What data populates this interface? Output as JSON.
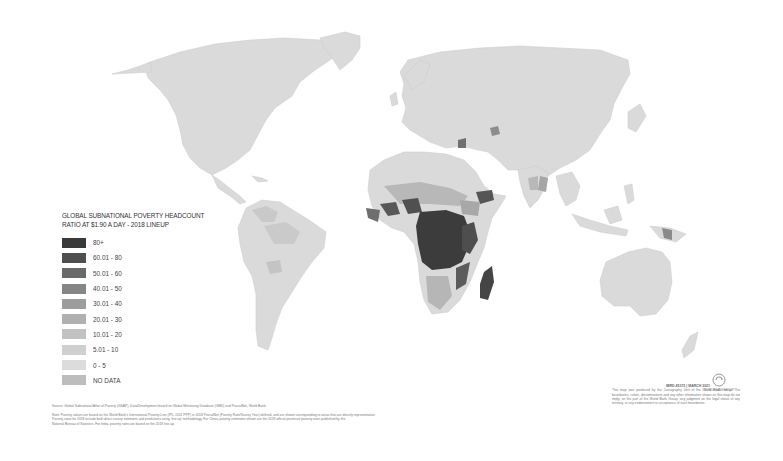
{
  "map": {
    "title_line1": "GLOBAL SUBNATIONAL POVERTY HEADCOUNT",
    "title_line2": "RATIO AT $1.90 A DAY - 2018 LINEUP",
    "legend": [
      {
        "label": "80+",
        "color": "#3a3a3a"
      },
      {
        "label": "60.01 - 80",
        "color": "#4f4f4f"
      },
      {
        "label": "50.01 - 60",
        "color": "#6a6a6a"
      },
      {
        "label": "40.01 - 50",
        "color": "#858585"
      },
      {
        "label": "30.01 - 40",
        "color": "#9d9d9d"
      },
      {
        "label": "20.01 - 30",
        "color": "#b0b0b0"
      },
      {
        "label": "10.01 - 20",
        "color": "#c2c2c2"
      },
      {
        "label": "5.01 - 10",
        "color": "#cfcfcf"
      },
      {
        "label": "0 - 5",
        "color": "#dcdcdc"
      },
      {
        "label": "NO DATA",
        "color": "#bdbdbd"
      }
    ]
  },
  "footer": {
    "source": "Source: Global Subnational Atlas of Poverty (GSAP), Data/Development based on Global Monitoring Database (GMD) and PovcalNet, World Bank.",
    "note_line1": "Note: Poverty values are based on the World Bank's International Poverty Line (IPL, 2011 PPP) in 2018 PovcalNet (Poverty Rate/Survey Year) defined, and are shown corresponding to areas that are directly representative.",
    "note_line2": "Poverty rates for 2018 include both direct survey estimates and predictions using 'line-up' methodology. For China, poverty estimates shown are the 2018 official provincial poverty rates published by the",
    "note_line3": "National Bureau of Statistics. For India, poverty rates are based on the 2018 line-up.",
    "doc_id": "IBRD 45372 | MARCH 2021",
    "disclaimer": "This map was produced by the Cartography Unit of the World Bank Group. The boundaries, colors, denominations and any other information shown on this map do not imply, on the part of the World Bank Group, any judgment on the legal status of any territory, or any endorsement or acceptance of such boundaries.",
    "logo_text": "WORLD BANK GROUP"
  }
}
